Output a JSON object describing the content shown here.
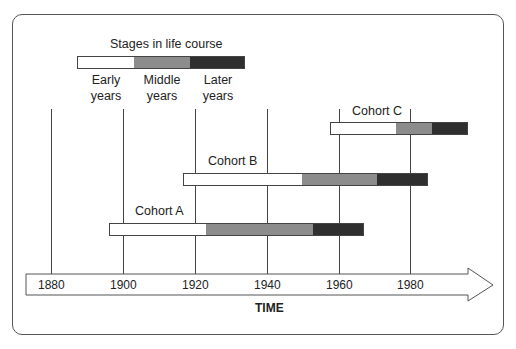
{
  "legend": {
    "title": "Stages in life course",
    "stages": [
      {
        "label_line1": "Early",
        "label_line2": "years",
        "color": "#ffffff"
      },
      {
        "label_line1": "Middle",
        "label_line2": "years",
        "color": "#8c8c8c"
      },
      {
        "label_line1": "Later",
        "label_line2": "years",
        "color": "#2f2f2f"
      }
    ]
  },
  "cohorts": [
    {
      "label": "Cohort A",
      "start": 1896,
      "early_end": 1923,
      "middle_end": 1953,
      "end": 1967
    },
    {
      "label": "Cohort B",
      "start": 1916,
      "early_end": 1949,
      "middle_end": 1970,
      "end": 1984
    },
    {
      "label": "Cohort C",
      "start": 1957,
      "early_end": 1975,
      "middle_end": 1985,
      "end": 1995
    }
  ],
  "axis": {
    "label": "TIME",
    "ticks": [
      "1880",
      "1900",
      "1920",
      "1940",
      "1960",
      "1980"
    ]
  }
}
